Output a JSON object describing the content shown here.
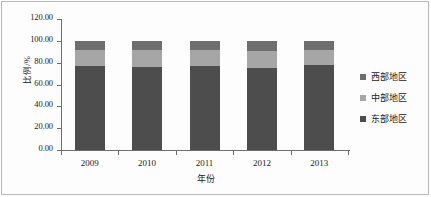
{
  "chart_data": {
    "type": "bar",
    "subtype": "stacked-bar-100-percent",
    "title": "",
    "xlabel": "年份",
    "ylabel": "比例/%",
    "categories": [
      "2009",
      "2010",
      "2011",
      "2012",
      "2013"
    ],
    "ylim": [
      0,
      120
    ],
    "yticks": [
      "0.00",
      "20.00",
      "40.00",
      "60.00",
      "80.00",
      "100.00",
      "120.00"
    ],
    "ytick_values": [
      0,
      20,
      40,
      60,
      80,
      100,
      120
    ],
    "grid": false,
    "legend_position": "right",
    "stack_order_bottom_to_top": [
      "东部地区",
      "中部地区",
      "西部地区"
    ],
    "series": [
      {
        "name": "东部地区",
        "color": "#4d4d4d",
        "values": [
          76.8,
          75.6,
          77.0,
          75.0,
          77.5
        ]
      },
      {
        "name": "中部地区",
        "color": "#a6a6a6",
        "values": [
          14.5,
          15.6,
          14.5,
          16.0,
          14.0
        ]
      },
      {
        "name": "西部地区",
        "color": "#6e6e6e",
        "values": [
          8.7,
          8.8,
          8.5,
          9.0,
          8.5
        ]
      }
    ]
  },
  "legend": {
    "items": [
      {
        "label": "西部地区",
        "color": "#6e6e6e"
      },
      {
        "label": "中部地区",
        "color": "#a6a6a6"
      },
      {
        "label": "东部地区",
        "color": "#4d4d4d"
      }
    ]
  }
}
